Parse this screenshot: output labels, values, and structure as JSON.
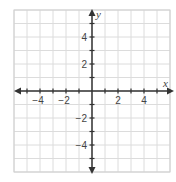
{
  "chart_data": {
    "type": "scatter",
    "title": "",
    "xlabel": "x",
    "ylabel": "y",
    "xlim": [
      -6,
      6
    ],
    "ylim": [
      -6,
      6
    ],
    "grid": true,
    "grid_step": 1,
    "x_ticks": [
      -4,
      -2,
      2,
      4
    ],
    "y_ticks": [
      4,
      2,
      -2,
      -4
    ],
    "x_tick_labels": [
      "−4",
      "−2",
      "2",
      "4"
    ],
    "y_tick_labels": [
      "4",
      "2",
      "−2",
      "−4"
    ],
    "series": [],
    "legend": null,
    "arrows": {
      "x_axis": "both",
      "y_axis": "both"
    }
  },
  "style": {
    "grid_color": "#dcdcdc",
    "border_color": "#cfcfcf",
    "axis_color": "#333333",
    "text_color": "#444444"
  },
  "layout": {
    "left": 14,
    "right": 170,
    "top": 10,
    "bottom": 172,
    "origin_x": 92,
    "origin_y": 91
  }
}
